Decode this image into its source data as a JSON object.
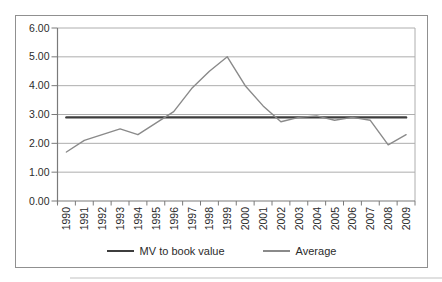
{
  "figure": {
    "border_color": "#909090",
    "background": "#ffffff",
    "text_color": "#2b2b2b"
  },
  "chart_data": {
    "type": "line",
    "title": "",
    "xlabel": "",
    "ylabel": "",
    "categories": [
      "1990",
      "1991",
      "1992",
      "1993",
      "1994",
      "1995",
      "1996",
      "1997",
      "1998",
      "1999",
      "2000",
      "2001",
      "2002",
      "2003",
      "2004",
      "2005",
      "2006",
      "2007",
      "2008",
      "2009"
    ],
    "series": [
      {
        "name": "MV to book value",
        "color": "#3d3d3d",
        "stroke_width": 2.4,
        "values": [
          2.9,
          2.9,
          2.9,
          2.9,
          2.9,
          2.9,
          2.9,
          2.9,
          2.9,
          2.9,
          2.9,
          2.9,
          2.9,
          2.9,
          2.9,
          2.9,
          2.9,
          2.9,
          2.9,
          2.9
        ]
      },
      {
        "name": "Average",
        "color": "#8a8a8a",
        "stroke_width": 1.4,
        "values": [
          1.7,
          2.1,
          2.3,
          2.5,
          2.3,
          2.7,
          3.1,
          3.9,
          4.5,
          5.0,
          4.0,
          3.3,
          2.75,
          2.9,
          2.95,
          2.8,
          2.9,
          2.8,
          1.95,
          2.3
        ]
      }
    ],
    "ylim": [
      0,
      6
    ],
    "ytick_step": 1,
    "ytick_labels": [
      "0.00",
      "1.00",
      "2.00",
      "3.00",
      "4.00",
      "5.00",
      "6.00"
    ],
    "grid": true,
    "grid_color": "#aeaeae",
    "axis_color": "#7a7a7a",
    "legend_position": "bottom",
    "x_label_rotation": -90
  }
}
